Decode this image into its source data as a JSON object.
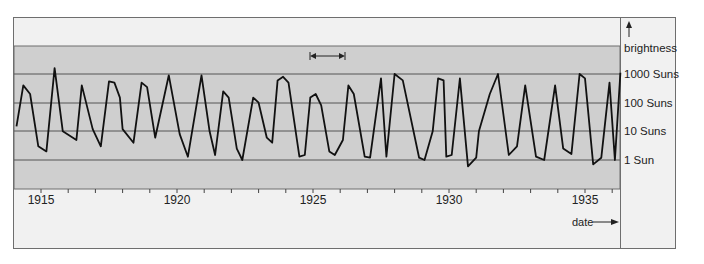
{
  "chart_data": {
    "type": "line",
    "title": "",
    "xlabel": "date",
    "ylabel": "brightness",
    "x_axis": {
      "ticks": [
        "1915",
        "1920",
        "1925",
        "1930",
        "1935"
      ],
      "range": [
        1914.1,
        1936.3
      ],
      "minor_ticks_per_year": 1
    },
    "y_axis": {
      "scale": "log",
      "ticks": [
        "1 Sun",
        "10 Suns",
        "100 Suns",
        "1000 Suns"
      ],
      "tick_values": [
        1,
        10,
        100,
        1000
      ],
      "range": [
        0.1,
        10000
      ]
    },
    "grid": true,
    "annotation": {
      "type": "double-arrow",
      "label": "",
      "span_years": [
        1925.0,
        1926.2
      ],
      "meaning": "one pulsation period"
    },
    "series": [
      {
        "name": "brightness",
        "points": [
          [
            1914.1,
            15
          ],
          [
            1914.35,
            400
          ],
          [
            1914.6,
            200
          ],
          [
            1914.9,
            3
          ],
          [
            1915.2,
            2
          ],
          [
            1915.5,
            1600
          ],
          [
            1915.8,
            10
          ],
          [
            1916.3,
            5
          ],
          [
            1916.5,
            400
          ],
          [
            1916.9,
            12
          ],
          [
            1917.2,
            3
          ],
          [
            1917.5,
            550
          ],
          [
            1917.7,
            500
          ],
          [
            1917.9,
            150
          ],
          [
            1918.0,
            12
          ],
          [
            1918.4,
            4
          ],
          [
            1918.7,
            500
          ],
          [
            1918.9,
            350
          ],
          [
            1919.2,
            6
          ],
          [
            1919.7,
            900
          ],
          [
            1920.1,
            8
          ],
          [
            1920.4,
            1.3
          ],
          [
            1920.9,
            900
          ],
          [
            1921.2,
            10
          ],
          [
            1921.4,
            1.5
          ],
          [
            1921.7,
            250
          ],
          [
            1921.9,
            150
          ],
          [
            1922.2,
            2.5
          ],
          [
            1922.4,
            1
          ],
          [
            1922.8,
            150
          ],
          [
            1923.0,
            100
          ],
          [
            1923.3,
            6
          ],
          [
            1923.5,
            4
          ],
          [
            1923.7,
            600
          ],
          [
            1923.9,
            800
          ],
          [
            1924.1,
            500
          ],
          [
            1924.5,
            1.3
          ],
          [
            1924.7,
            1.5
          ],
          [
            1924.9,
            150
          ],
          [
            1925.1,
            200
          ],
          [
            1925.3,
            80
          ],
          [
            1925.6,
            2
          ],
          [
            1925.8,
            1.5
          ],
          [
            1926.1,
            5
          ],
          [
            1926.3,
            400
          ],
          [
            1926.5,
            200
          ],
          [
            1926.9,
            1.3
          ],
          [
            1927.1,
            1.2
          ],
          [
            1927.5,
            700
          ],
          [
            1927.7,
            1.3
          ],
          [
            1928.0,
            1000
          ],
          [
            1928.3,
            600
          ],
          [
            1928.9,
            1.2
          ],
          [
            1929.1,
            1
          ],
          [
            1929.4,
            10
          ],
          [
            1929.6,
            700
          ],
          [
            1929.8,
            600
          ],
          [
            1929.9,
            1.3
          ],
          [
            1930.1,
            1.5
          ],
          [
            1930.4,
            700
          ],
          [
            1930.7,
            0.6
          ],
          [
            1931.0,
            1.2
          ],
          [
            1931.1,
            10
          ],
          [
            1931.5,
            200
          ],
          [
            1931.8,
            1000
          ],
          [
            1932.2,
            1.5
          ],
          [
            1932.5,
            3
          ],
          [
            1932.8,
            400
          ],
          [
            1933.2,
            1.3
          ],
          [
            1933.5,
            1
          ],
          [
            1933.9,
            400
          ],
          [
            1934.2,
            2.5
          ],
          [
            1934.5,
            1.6
          ],
          [
            1934.8,
            1000
          ],
          [
            1935.0,
            700
          ],
          [
            1935.3,
            0.7
          ],
          [
            1935.6,
            1.2
          ],
          [
            1935.9,
            500
          ],
          [
            1936.1,
            1
          ],
          [
            1936.3,
            1100
          ]
        ]
      }
    ]
  },
  "labels": {
    "y_title": "brightness",
    "y_ticks": [
      "1000 Suns",
      "100 Suns",
      "10 Suns",
      "1 Sun"
    ],
    "x_ticks": [
      "1915",
      "1920",
      "1925",
      "1930",
      "1935"
    ],
    "x_title": "date"
  },
  "colors": {
    "band": "#cfcfcf",
    "frame_bg": "#f1f1f1",
    "line": "#111111",
    "grid": "#555555"
  }
}
